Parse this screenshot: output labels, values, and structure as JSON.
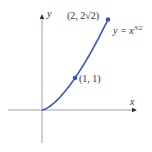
{
  "chart_data": {
    "type": "line",
    "title": "",
    "xlabel": "x",
    "ylabel": "y",
    "function": "y = x^{3/2}",
    "curve_label": "y = x",
    "curve_exponent": "3/2",
    "series": [
      {
        "name": "y = x^(3/2)",
        "x": [
          0,
          0.5,
          1,
          1.5,
          2
        ],
        "y": [
          0,
          0.354,
          1,
          1.837,
          2.828
        ]
      }
    ],
    "points": [
      {
        "label": "(1, 1)",
        "x": 1,
        "y": 1
      },
      {
        "label": "(2, 2√2)",
        "x": 2,
        "y": 2.828
      }
    ],
    "xlim": [
      -1,
      2.9
    ],
    "ylim": [
      -1,
      3
    ],
    "grid": false,
    "colors": {
      "curve": "#3a56c4",
      "axis": "#777777"
    }
  }
}
